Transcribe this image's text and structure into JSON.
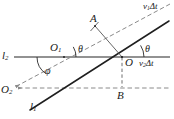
{
  "figure": {
    "type": "geometry-diagram",
    "background_color": "#ffffff",
    "ink_color": "#1a1a1a",
    "guide_color": "#8a8a8a",
    "baseline_color": "#6e6e6e"
  },
  "labels": {
    "line_l2": "l",
    "line_l2_sub": "2",
    "line_l1": "l",
    "line_l1_sub": "1",
    "point_O": "O",
    "point_O1": "O",
    "point_O1_sub": "1",
    "point_O2": "O",
    "point_O2_sub": "2",
    "point_A": "A",
    "point_B": "B",
    "angle_theta_left": "θ",
    "angle_theta_right": "θ",
    "angle_phi": "φ",
    "vector_v1": "v",
    "vector_v1_sub": "1",
    "vector_v1_delta": "Δt",
    "vector_v2": "v",
    "vector_v2_sub": "2",
    "vector_v2_delta": "Δt"
  },
  "geometry": {
    "baseline_l2": {
      "x1": 14,
      "y1": 57,
      "x2": 170,
      "y2": 57
    },
    "line_l1": {
      "x1": 30,
      "y1": 110,
      "x2": 169,
      "y2": 21
    },
    "wavefront_dashed": {
      "x1": 12,
      "y1": 88,
      "x2": 170,
      "y2": 4
    },
    "horizontal_dashed": {
      "x1": 14,
      "y1": 88,
      "x2": 170,
      "y2": 88
    },
    "perp_A_to_O": {
      "x1": 95,
      "y1": 26,
      "x2": 122,
      "y2": 57
    },
    "drop_O_to_B": {
      "x1": 122,
      "y1": 57,
      "x2": 122,
      "y2": 88
    },
    "point_O": {
      "x": 122,
      "y": 57
    },
    "point_O1": {
      "x": 57,
      "y": 57
    },
    "point_O2": {
      "x": 14,
      "y": 88
    },
    "point_A": {
      "x": 95,
      "y": 26
    },
    "point_B": {
      "x": 122,
      "y": 88
    },
    "angle_theta_left_deg": 32,
    "angle_theta_right_deg": 32,
    "angle_phi_deg": 148
  }
}
